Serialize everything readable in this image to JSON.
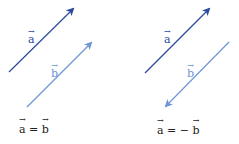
{
  "colors": {
    "vector_a": "#2a4aa0",
    "vector_b": "#6e95d6",
    "text": "#222222"
  },
  "panels": [
    {
      "vector_a": {
        "label": "a",
        "from": [
          9,
          72
        ],
        "to": [
          73,
          8
        ]
      },
      "vector_b": {
        "label": "b",
        "from": [
          27,
          107
        ],
        "to": [
          91,
          42
        ]
      },
      "equation": {
        "lhs": "a",
        "op": "=",
        "neg": "",
        "rhs": "b"
      }
    },
    {
      "vector_a": {
        "label": "a",
        "from": [
          145,
          73
        ],
        "to": [
          209,
          8
        ]
      },
      "vector_b": {
        "label": "b",
        "from": [
          229,
          42
        ],
        "to": [
          165,
          107
        ]
      },
      "equation": {
        "lhs": "a",
        "op": "=",
        "neg": "−",
        "rhs": "b"
      }
    }
  ]
}
